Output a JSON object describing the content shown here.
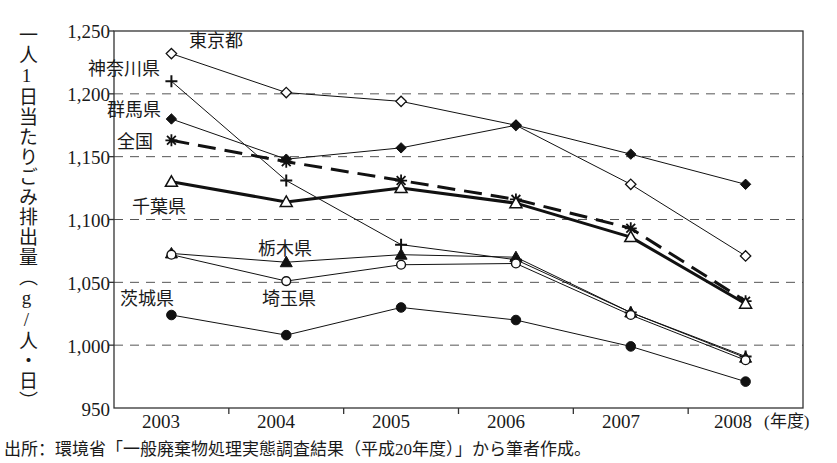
{
  "axis": {
    "y_title": "一人1日当たりごみ排出量（g/人・日）",
    "x_unit": "(年度)",
    "y_ticks": [
      "1,250",
      "1,200",
      "1,150",
      "1,100",
      "1,050",
      "1,000",
      "950"
    ],
    "x_ticks": [
      "2003",
      "2004",
      "2005",
      "2006",
      "2007",
      "2008"
    ]
  },
  "labels": {
    "tokyo": "東京都",
    "kanagawa": "神奈川県",
    "gunma": "群馬県",
    "national": "全国",
    "chiba": "千葉県",
    "tochigi": "栃木県",
    "ibaraki": "茨城県",
    "saitama": "埼玉県"
  },
  "source": "出所：環境省「一般廃棄物処理実態調査結果（平成20年度）」から筆者作成。",
  "colors": {
    "line": "#111111",
    "grid": "#555555",
    "frame": "#333333",
    "text": "#1a1a1a"
  },
  "chart_data": {
    "type": "line",
    "title": "",
    "xlabel": "(年度)",
    "ylabel": "一人1日当たりごみ排出量（g/人・日）",
    "categories": [
      "2003",
      "2004",
      "2005",
      "2006",
      "2007",
      "2008"
    ],
    "ylim": [
      950,
      1250
    ],
    "ytick_step": 50,
    "grid": true,
    "legend": "inline-labels",
    "series": [
      {
        "name": "東京都",
        "marker": "open-diamond",
        "linestyle": "solid",
        "linewidth": 1,
        "values": [
          1232,
          1201,
          1194,
          1175,
          1128,
          1071
        ]
      },
      {
        "name": "神奈川県",
        "marker": "plus",
        "linestyle": "solid",
        "linewidth": 1,
        "values": [
          1210,
          1131,
          1080,
          1068,
          1026,
          991
        ]
      },
      {
        "name": "群馬県",
        "marker": "filled-diamond",
        "linestyle": "solid",
        "linewidth": 1,
        "values": [
          1180,
          1148,
          1157,
          1175,
          1152,
          1128
        ]
      },
      {
        "name": "全国",
        "marker": "asterisk",
        "linestyle": "dashed",
        "linewidth": 3,
        "values": [
          1163,
          1146,
          1131,
          1116,
          1093,
          1035
        ]
      },
      {
        "name": "千葉県",
        "marker": "open-triangle",
        "linestyle": "solid",
        "linewidth": 3,
        "values": [
          1130,
          1114,
          1125,
          1113,
          1086,
          1033
        ]
      },
      {
        "name": "栃木県",
        "marker": "filled-triangle",
        "linestyle": "solid",
        "linewidth": 1,
        "values": [
          1073,
          1066,
          1072,
          1070,
          1026,
          990
        ]
      },
      {
        "name": "埼玉県",
        "marker": "open-circle",
        "linestyle": "solid",
        "linewidth": 1,
        "values": [
          1072,
          1051,
          1064,
          1065,
          1024,
          988
        ]
      },
      {
        "name": "茨城県",
        "marker": "filled-circle",
        "linestyle": "solid",
        "linewidth": 1,
        "values": [
          1024,
          1008,
          1030,
          1020,
          999,
          971
        ]
      }
    ]
  }
}
